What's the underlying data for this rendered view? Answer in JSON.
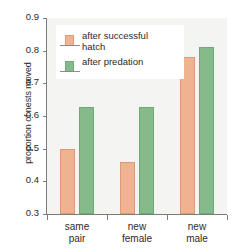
{
  "chart_data": {
    "type": "bar",
    "title": "",
    "xlabel": "",
    "ylabel": "proportion of nests moved",
    "ylim": [
      0.3,
      0.9
    ],
    "yticks": [
      "0.3",
      "0.4",
      "0.5",
      "0.6",
      "0.7",
      "0.8",
      "0.9"
    ],
    "grid": false,
    "legend_position": "top-left-inside",
    "categories": [
      "same pair",
      "new female",
      "new male"
    ],
    "category_lines": [
      [
        "same",
        "pair"
      ],
      [
        "new",
        "female"
      ],
      [
        "new",
        "male"
      ]
    ],
    "series": [
      {
        "name": "after successful hatch",
        "name_lines": [
          "after successful",
          "hatch"
        ],
        "color": "#f0b393",
        "edge_color": "#dd9c78",
        "values": [
          0.5,
          0.46,
          0.78
        ]
      },
      {
        "name": "after predation",
        "name_lines": [
          "after predation"
        ],
        "color": "#85ba8b",
        "edge_color": "#6fa978",
        "values": [
          0.628,
          0.628,
          0.81
        ]
      }
    ]
  },
  "figure": {
    "background": "#ffffff",
    "plot_background": "#f4f4f2",
    "axis_color": "#7c7c7c"
  }
}
